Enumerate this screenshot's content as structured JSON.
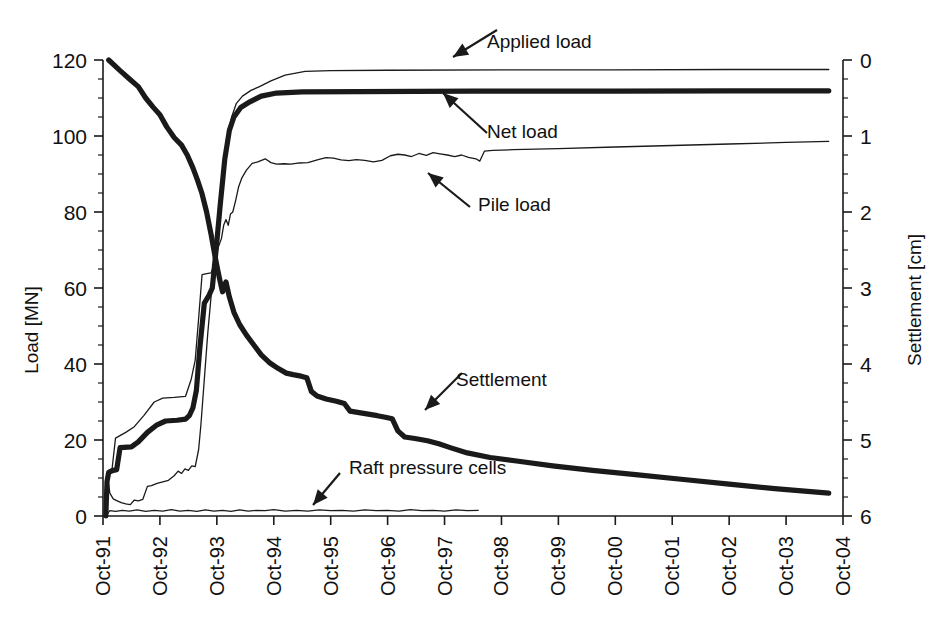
{
  "chart_data": {
    "type": "line",
    "title": "",
    "xlabel": "",
    "ylabel": "Load [MN]",
    "y2label": "Settlement [cm]",
    "grid": false,
    "legend_position": "inline-annotations",
    "x_categories": [
      "Oct-91",
      "Oct-92",
      "Oct-93",
      "Oct-94",
      "Oct-95",
      "Oct-96",
      "Oct-97",
      "Oct-98",
      "Oct-99",
      "Oct-00",
      "Oct-01",
      "Oct-02",
      "Oct-03",
      "Oct-04"
    ],
    "xlim": [
      0,
      13
    ],
    "ylim": [
      0,
      120
    ],
    "y_ticks": [
      0,
      20,
      40,
      60,
      80,
      100,
      120
    ],
    "y_minor_step": 5,
    "y2lim": [
      0,
      6
    ],
    "y2_ticks": [
      0,
      1,
      2,
      3,
      4,
      5,
      6
    ],
    "y2_minor_step": 0.25,
    "y2_inverted": true,
    "series": [
      {
        "name": "Applied load",
        "axis": "left",
        "style": "thin",
        "annotation": "Applied load",
        "points": [
          [
            0.05,
            0.0
          ],
          [
            0.07,
            10.0
          ],
          [
            0.1,
            12.0
          ],
          [
            0.16,
            12.5
          ],
          [
            0.22,
            20.5
          ],
          [
            0.4,
            22.0
          ],
          [
            0.55,
            23.5
          ],
          [
            0.72,
            26.5
          ],
          [
            0.9,
            30.0
          ],
          [
            1.05,
            31.0
          ],
          [
            1.25,
            31.2
          ],
          [
            1.45,
            31.5
          ],
          [
            1.55,
            36.0
          ],
          [
            1.62,
            41.0
          ],
          [
            1.68,
            52.0
          ],
          [
            1.74,
            63.5
          ],
          [
            1.82,
            63.8
          ],
          [
            1.9,
            64.0
          ],
          [
            1.95,
            66.0
          ],
          [
            2.02,
            78.0
          ],
          [
            2.1,
            90.0
          ],
          [
            2.18,
            99.5
          ],
          [
            2.26,
            105.0
          ],
          [
            2.34,
            108.5
          ],
          [
            2.45,
            110.5
          ],
          [
            2.6,
            112.0
          ],
          [
            2.75,
            113.0
          ],
          [
            2.95,
            114.5
          ],
          [
            3.2,
            116.0
          ],
          [
            3.55,
            117.0
          ],
          [
            4.0,
            117.2
          ],
          [
            5.0,
            117.3
          ],
          [
            7.0,
            117.4
          ],
          [
            9.0,
            117.4
          ],
          [
            11.0,
            117.5
          ],
          [
            12.75,
            117.5
          ]
        ]
      },
      {
        "name": "Net load",
        "axis": "left",
        "style": "thick",
        "annotation": "Net load",
        "points": [
          [
            0.05,
            0.0
          ],
          [
            0.07,
            9.0
          ],
          [
            0.1,
            11.5
          ],
          [
            0.18,
            12.0
          ],
          [
            0.24,
            12.2
          ],
          [
            0.3,
            18.0
          ],
          [
            0.5,
            18.2
          ],
          [
            0.62,
            19.5
          ],
          [
            0.78,
            22.0
          ],
          [
            0.95,
            24.0
          ],
          [
            1.1,
            25.0
          ],
          [
            1.3,
            25.2
          ],
          [
            1.45,
            25.5
          ],
          [
            1.52,
            26.5
          ],
          [
            1.58,
            28.5
          ],
          [
            1.64,
            33.0
          ],
          [
            1.7,
            44.0
          ],
          [
            1.78,
            56.0
          ],
          [
            1.86,
            58.0
          ],
          [
            1.92,
            60.0
          ],
          [
            1.98,
            69.0
          ],
          [
            2.06,
            82.0
          ],
          [
            2.14,
            94.0
          ],
          [
            2.22,
            101.5
          ],
          [
            2.3,
            105.0
          ],
          [
            2.42,
            107.5
          ],
          [
            2.58,
            109.0
          ],
          [
            2.78,
            110.5
          ],
          [
            3.05,
            111.3
          ],
          [
            3.5,
            111.6
          ],
          [
            4.5,
            111.7
          ],
          [
            6.5,
            111.8
          ],
          [
            9.0,
            111.8
          ],
          [
            11.0,
            111.9
          ],
          [
            12.75,
            111.9
          ]
        ]
      },
      {
        "name": "Pile load",
        "axis": "left",
        "style": "thin",
        "annotation": "Pile load",
        "points": [
          [
            0.05,
            0.0
          ],
          [
            0.08,
            10.5
          ],
          [
            0.12,
            6.0
          ],
          [
            0.18,
            4.5
          ],
          [
            0.25,
            4.0
          ],
          [
            0.32,
            3.5
          ],
          [
            0.4,
            3.2
          ],
          [
            0.48,
            3.0
          ],
          [
            0.55,
            4.2
          ],
          [
            0.62,
            4.0
          ],
          [
            0.7,
            4.4
          ],
          [
            0.78,
            7.8
          ],
          [
            0.85,
            8.0
          ],
          [
            0.95,
            8.6
          ],
          [
            1.05,
            9.0
          ],
          [
            1.15,
            9.4
          ],
          [
            1.25,
            10.6
          ],
          [
            1.32,
            11.8
          ],
          [
            1.38,
            11.2
          ],
          [
            1.44,
            12.4
          ],
          [
            1.5,
            12.0
          ],
          [
            1.56,
            13.2
          ],
          [
            1.62,
            13.0
          ],
          [
            1.68,
            17.5
          ],
          [
            1.72,
            24.0
          ],
          [
            1.78,
            36.0
          ],
          [
            1.84,
            48.0
          ],
          [
            1.9,
            58.0
          ],
          [
            1.96,
            66.0
          ],
          [
            2.02,
            70.5
          ],
          [
            2.08,
            73.0
          ],
          [
            2.12,
            76.5
          ],
          [
            2.16,
            78.0
          ],
          [
            2.2,
            76.5
          ],
          [
            2.24,
            79.5
          ],
          [
            2.28,
            80.0
          ],
          [
            2.33,
            83.0
          ],
          [
            2.38,
            86.5
          ],
          [
            2.44,
            89.0
          ],
          [
            2.52,
            91.0
          ],
          [
            2.62,
            92.8
          ],
          [
            2.72,
            93.2
          ],
          [
            2.85,
            94.0
          ],
          [
            2.95,
            93.0
          ],
          [
            3.05,
            92.6
          ],
          [
            3.18,
            92.7
          ],
          [
            3.3,
            92.6
          ],
          [
            3.45,
            92.9
          ],
          [
            3.6,
            93.0
          ],
          [
            3.78,
            93.8
          ],
          [
            3.92,
            94.3
          ],
          [
            4.05,
            94.2
          ],
          [
            4.18,
            93.7
          ],
          [
            4.32,
            93.5
          ],
          [
            4.45,
            93.8
          ],
          [
            4.6,
            93.6
          ],
          [
            4.75,
            93.2
          ],
          [
            4.9,
            93.6
          ],
          [
            5.05,
            94.8
          ],
          [
            5.18,
            95.2
          ],
          [
            5.3,
            95.0
          ],
          [
            5.42,
            94.6
          ],
          [
            5.55,
            95.4
          ],
          [
            5.68,
            94.9
          ],
          [
            5.8,
            95.6
          ],
          [
            5.92,
            95.3
          ],
          [
            6.05,
            95.0
          ],
          [
            6.18,
            94.6
          ],
          [
            6.3,
            95.0
          ],
          [
            6.42,
            94.4
          ],
          [
            6.55,
            94.0
          ],
          [
            6.62,
            93.4
          ],
          [
            6.7,
            96.0
          ],
          [
            6.85,
            96.2
          ],
          [
            7.2,
            96.4
          ],
          [
            8.0,
            96.7
          ],
          [
            9.0,
            97.1
          ],
          [
            10.0,
            97.5
          ],
          [
            11.0,
            97.9
          ],
          [
            12.0,
            98.3
          ],
          [
            12.75,
            98.6
          ]
        ]
      },
      {
        "name": "Settlement",
        "axis": "right",
        "style": "thick",
        "annotation": "Settlement",
        "points": [
          [
            0.1,
            0.0
          ],
          [
            0.3,
            0.14
          ],
          [
            0.48,
            0.26
          ],
          [
            0.62,
            0.35
          ],
          [
            0.75,
            0.5
          ],
          [
            0.88,
            0.62
          ],
          [
            1.0,
            0.72
          ],
          [
            1.12,
            0.88
          ],
          [
            1.25,
            1.02
          ],
          [
            1.38,
            1.12
          ],
          [
            1.48,
            1.25
          ],
          [
            1.58,
            1.42
          ],
          [
            1.66,
            1.58
          ],
          [
            1.74,
            1.76
          ],
          [
            1.82,
            2.0
          ],
          [
            1.9,
            2.3
          ],
          [
            1.96,
            2.55
          ],
          [
            2.02,
            2.78
          ],
          [
            2.06,
            2.92
          ],
          [
            2.1,
            3.05
          ],
          [
            2.16,
            2.92
          ],
          [
            2.22,
            3.12
          ],
          [
            2.3,
            3.32
          ],
          [
            2.4,
            3.48
          ],
          [
            2.52,
            3.62
          ],
          [
            2.64,
            3.74
          ],
          [
            2.78,
            3.88
          ],
          [
            2.92,
            3.98
          ],
          [
            3.08,
            4.06
          ],
          [
            3.22,
            4.12
          ],
          [
            3.34,
            4.14
          ],
          [
            3.48,
            4.16
          ],
          [
            3.58,
            4.18
          ],
          [
            3.66,
            4.36
          ],
          [
            3.76,
            4.42
          ],
          [
            3.92,
            4.46
          ],
          [
            4.1,
            4.49
          ],
          [
            4.24,
            4.52
          ],
          [
            4.34,
            4.62
          ],
          [
            4.5,
            4.64
          ],
          [
            4.66,
            4.66
          ],
          [
            4.82,
            4.68
          ],
          [
            4.96,
            4.7
          ],
          [
            5.08,
            4.72
          ],
          [
            5.18,
            4.88
          ],
          [
            5.3,
            4.96
          ],
          [
            5.48,
            4.98
          ],
          [
            5.7,
            5.01
          ],
          [
            5.9,
            5.05
          ],
          [
            6.1,
            5.1
          ],
          [
            6.4,
            5.17
          ],
          [
            6.8,
            5.23
          ],
          [
            7.3,
            5.28
          ],
          [
            7.9,
            5.34
          ],
          [
            8.6,
            5.4
          ],
          [
            9.4,
            5.46
          ],
          [
            10.2,
            5.52
          ],
          [
            11.0,
            5.58
          ],
          [
            11.8,
            5.64
          ],
          [
            12.75,
            5.7
          ]
        ]
      },
      {
        "name": "Raft pressure cells",
        "axis": "left",
        "style": "raft",
        "annotation": "Raft pressure cells",
        "points": [
          [
            0.05,
            0.0
          ],
          [
            0.12,
            1.4
          ],
          [
            0.22,
            1.2
          ],
          [
            0.34,
            1.5
          ],
          [
            0.46,
            1.3
          ],
          [
            0.6,
            1.6
          ],
          [
            0.75,
            1.2
          ],
          [
            0.9,
            1.5
          ],
          [
            1.05,
            1.3
          ],
          [
            1.2,
            1.7
          ],
          [
            1.35,
            1.3
          ],
          [
            1.5,
            1.5
          ],
          [
            1.65,
            1.2
          ],
          [
            1.8,
            1.6
          ],
          [
            1.95,
            1.3
          ],
          [
            2.1,
            1.5
          ],
          [
            2.25,
            1.2
          ],
          [
            2.4,
            1.6
          ],
          [
            2.55,
            1.3
          ],
          [
            2.7,
            1.5
          ],
          [
            2.85,
            1.4
          ],
          [
            3.0,
            1.7
          ],
          [
            3.2,
            1.3
          ],
          [
            3.4,
            1.5
          ],
          [
            3.6,
            1.3
          ],
          [
            3.8,
            1.6
          ],
          [
            4.0,
            1.4
          ],
          [
            4.2,
            1.5
          ],
          [
            4.4,
            1.3
          ],
          [
            4.6,
            1.6
          ],
          [
            4.8,
            1.4
          ],
          [
            5.0,
            1.5
          ],
          [
            5.2,
            1.3
          ],
          [
            5.4,
            1.7
          ],
          [
            5.6,
            1.4
          ],
          [
            5.8,
            1.5
          ],
          [
            6.0,
            1.3
          ],
          [
            6.2,
            1.6
          ],
          [
            6.4,
            1.4
          ],
          [
            6.6,
            1.5
          ]
        ]
      }
    ],
    "annotations": [
      {
        "text": "Applied load",
        "label_x": 484,
        "label_y": 42
      },
      {
        "text": "Net load",
        "label_x": 484,
        "label_y": 128
      },
      {
        "text": "Pile load",
        "label_x": 474,
        "label_y": 201
      },
      {
        "text": "Settlement",
        "label_x": 452,
        "label_y": 379
      },
      {
        "text": "Raft pressure cells",
        "label_x": 345,
        "label_y": 469
      }
    ]
  },
  "colors": {
    "ink": "#1a1a1a",
    "background": "#ffffff"
  }
}
